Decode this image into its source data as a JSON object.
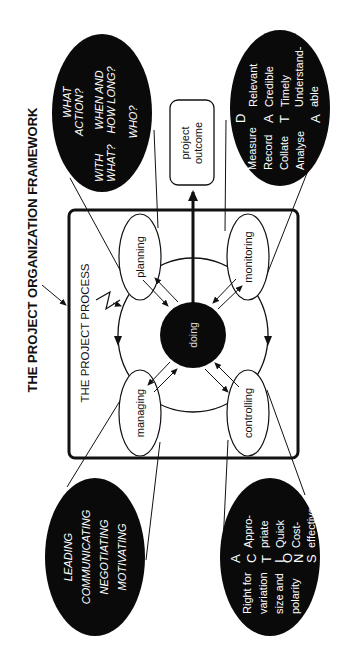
{
  "title": "THE PROJECT ORGANIZATION FRAMEWORK",
  "process_label": "THE PROJECT PROCESS",
  "center_node": "doing",
  "outcome": {
    "line1": "project",
    "line2": "outcome"
  },
  "process_nodes": {
    "planning": "planning",
    "monitoring": "monitoring",
    "managing": "managing",
    "controlling": "controlling"
  },
  "planning_questions": {
    "q1a": "WHAT",
    "q1b": "ACTION?",
    "q2a": "WITH",
    "q2b": "WHAT?",
    "q3a": "WHEN AND",
    "q3b": "HOW LONG?",
    "q4": "WHO?"
  },
  "monitoring_data": {
    "acronym": [
      "D",
      "A",
      "T",
      "A"
    ],
    "verbs": [
      "Measure",
      "Record",
      "Collate",
      "Analyse"
    ],
    "qualities": [
      "Relevant",
      "Credible",
      "Timely",
      "Understand-",
      "able"
    ]
  },
  "managing_skills": [
    "LEADING",
    "COMMUNICATING",
    "NEGOTIATING",
    "MOTIVATING"
  ],
  "controlling_actions": {
    "acronym": [
      "A",
      "C",
      "T",
      "I",
      "O",
      "N",
      "S"
    ],
    "left": [
      "Right for",
      "variation",
      "size and",
      "polarity"
    ],
    "right": [
      "Appro-",
      "priate",
      "Quick",
      "Cost-",
      "effective"
    ]
  },
  "colors": {
    "ink": "#111111",
    "background": "#ffffff",
    "fill_dark": "#0a0a0a"
  }
}
